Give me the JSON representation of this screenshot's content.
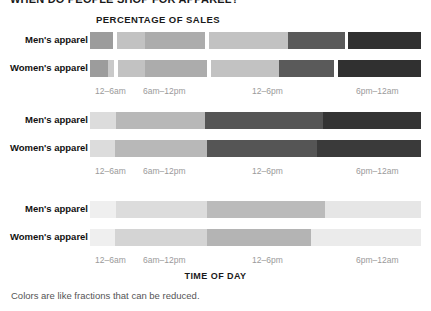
{
  "headline": "WHEN DO PEOPLE SHOP FOR APPAREL?",
  "caption": "Colors are like fractions that can be reduced.",
  "axis": {
    "y_axis_title": "PERCENTAGE OF SALES",
    "x_axis_title": "TIME OF DAY"
  },
  "ticks": [
    {
      "label": "12–6am",
      "left": 95
    },
    {
      "label": "6am–12pm",
      "left": 143
    },
    {
      "label": "12–6pm",
      "left": 252
    },
    {
      "label": "6pm–12am",
      "left": 356
    }
  ],
  "row_labels": {
    "mens": "Men's apparel",
    "womens": "Women's apparel"
  },
  "chart_data": {
    "type": "bar",
    "orientation": "horizontal",
    "stacked": true,
    "title": "WHEN DO PEOPLE SHOP FOR APPAREL?",
    "xlabel": "TIME OF DAY",
    "ylabel": "PERCENTAGE OF SALES",
    "categories": [
      "Men's apparel",
      "Women's apparel"
    ],
    "time_bins": [
      "12–6am",
      "6am–12pm",
      "12–6pm",
      "6pm–12am"
    ],
    "grid": false,
    "legend": "none",
    "xlim": [
      0,
      100
    ],
    "panels": [
      {
        "name": "panel-1-many-colors",
        "note": "Four time bins, each split into two sub-shades; white separators between bins.",
        "rows": [
          {
            "category": "Men's apparel",
            "segments": [
              {
                "bin": "12–6am",
                "pct": 7.0,
                "color": "#9c9c9c"
              },
              {
                "bin": "gap",
                "pct": 1.2,
                "color": "#ffffff"
              },
              {
                "bin": "6am–12pm",
                "pct": 8.5,
                "color": "#c2c2c2"
              },
              {
                "bin": "6am–12pm",
                "pct": 18.0,
                "color": "#acacac"
              },
              {
                "bin": "gap",
                "pct": 1.2,
                "color": "#ffffff"
              },
              {
                "bin": "12–6pm",
                "pct": 24.0,
                "color": "#c2c2c2"
              },
              {
                "bin": "12–6pm",
                "pct": 17.0,
                "color": "#5a5a5a"
              },
              {
                "bin": "gap",
                "pct": 1.2,
                "color": "#ffffff"
              },
              {
                "bin": "6pm–12am",
                "pct": 21.9,
                "color": "#303030"
              }
            ]
          },
          {
            "category": "Women's apparel",
            "segments": [
              {
                "bin": "12–6am",
                "pct": 5.5,
                "color": "#9c9c9c"
              },
              {
                "bin": "12–6am",
                "pct": 1.8,
                "color": "#c9c9c9"
              },
              {
                "bin": "gap",
                "pct": 1.2,
                "color": "#ffffff"
              },
              {
                "bin": "6am–12pm",
                "pct": 8.0,
                "color": "#c2c2c2"
              },
              {
                "bin": "6am–12pm",
                "pct": 19.0,
                "color": "#acacac"
              },
              {
                "bin": "gap",
                "pct": 1.2,
                "color": "#ffffff"
              },
              {
                "bin": "12–6pm",
                "pct": 20.5,
                "color": "#c2c2c2"
              },
              {
                "bin": "12–6pm",
                "pct": 16.5,
                "color": "#5a5a5a"
              },
              {
                "bin": "gap",
                "pct": 1.2,
                "color": "#ffffff"
              },
              {
                "bin": "6pm–12am",
                "pct": 25.1,
                "color": "#303030"
              }
            ]
          }
        ]
      },
      {
        "name": "panel-2-four-colors",
        "note": "Four time bins, one shade per bin, no separators.",
        "rows": [
          {
            "category": "Men's apparel",
            "segments": [
              {
                "bin": "12–6am",
                "pct": 7.9,
                "color": "#dcdcdc"
              },
              {
                "bin": "6am–12pm",
                "pct": 26.9,
                "color": "#b8b8b8"
              },
              {
                "bin": "12–6pm",
                "pct": 35.6,
                "color": "#555555"
              },
              {
                "bin": "6pm–12am",
                "pct": 29.6,
                "color": "#343434"
              }
            ]
          },
          {
            "category": "Women's apparel",
            "segments": [
              {
                "bin": "12–6am",
                "pct": 7.6,
                "color": "#dcdcdc"
              },
              {
                "bin": "6am–12pm",
                "pct": 27.8,
                "color": "#b8b8b8"
              },
              {
                "bin": "12–6pm",
                "pct": 33.2,
                "color": "#555555"
              },
              {
                "bin": "6pm–12am",
                "pct": 31.4,
                "color": "#3a3a3a"
              }
            ]
          }
        ]
      },
      {
        "name": "panel-3-two-colors",
        "note": "Reduced to two tones: pale background plus one highlighted middle block.",
        "rows": [
          {
            "category": "Men's apparel",
            "segments": [
              {
                "bin": "12–6am",
                "pct": 7.9,
                "color": "#efefef"
              },
              {
                "bin": "6am–12pm",
                "pct": 27.5,
                "color": "#dcdcdc"
              },
              {
                "bin": "12–6pm",
                "pct": 35.6,
                "color": "#bbbbbb"
              },
              {
                "bin": "6pm–12am",
                "pct": 29.0,
                "color": "#e6e6e6"
              }
            ]
          },
          {
            "category": "Women's apparel",
            "segments": [
              {
                "bin": "12–6am",
                "pct": 7.6,
                "color": "#efefef"
              },
              {
                "bin": "6am–12pm",
                "pct": 27.8,
                "color": "#d4d4d4"
              },
              {
                "bin": "12–6pm",
                "pct": 31.4,
                "color": "#b4b4b4"
              },
              {
                "bin": "6pm–12am",
                "pct": 33.2,
                "color": "#ebebeb"
              }
            ]
          }
        ]
      }
    ]
  }
}
